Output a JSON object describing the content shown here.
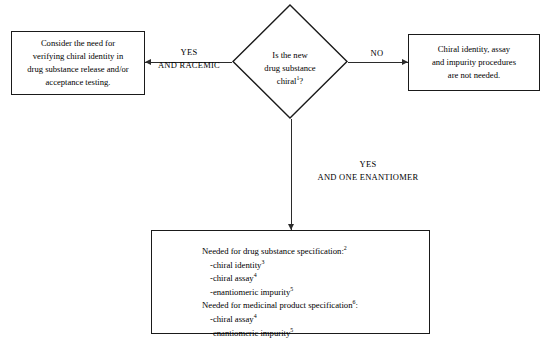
{
  "decision": {
    "text": "Is the new\ndrug substance\nchiral",
    "footnote": "1",
    "text_tail": "?"
  },
  "branches": {
    "left": {
      "label_line1": "YES",
      "label_line2": "AND RACEMIC",
      "outcome": "Consider the need for\nverifying chiral identity in\ndrug substance release and/or\nacceptance testing."
    },
    "right": {
      "label_line1": "NO",
      "outcome": "Chiral identity, assay\nand impurity procedures\nare not needed."
    },
    "down": {
      "label_line1": "YES",
      "label_line2": "AND ONE ENANTIOMER"
    }
  },
  "outcome_box": {
    "section1": {
      "heading": "Needed for drug substance specification:",
      "heading_footnote": "2",
      "items": [
        {
          "text": "-chiral identity",
          "footnote": "3"
        },
        {
          "text": "-chiral assay",
          "footnote": "4"
        },
        {
          "text": "-enantiomeric impurity",
          "footnote": "5"
        }
      ]
    },
    "section2": {
      "heading": "Needed for medicinal product specification",
      "heading_footnote": "6",
      "heading_tail": ":",
      "items": [
        {
          "text": "-chiral assay",
          "footnote": "4"
        },
        {
          "text": "-enantiomeric impurity",
          "footnote": "5"
        }
      ]
    }
  },
  "colors": {
    "background": "#ffffff",
    "stroke": "#1a1a1a",
    "connector": "#2b2b2b",
    "text": "#000000"
  }
}
